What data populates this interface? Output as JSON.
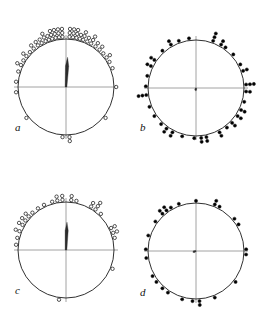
{
  "figure": {
    "type": "circular-scatter-multi-panel",
    "background": "#ffffff",
    "width": 264,
    "height": 325,
    "stroke_color": "#1a1a1a",
    "axis_color": "#8a8a8a",
    "marker_open_color": "#1a1a1a",
    "marker_fill_color": "#000000",
    "panel_count": 4,
    "layout": "2x2"
  },
  "chart_data": [
    {
      "type": "scatter",
      "subtype": "circular-distribution",
      "title": "a",
      "panel": "a",
      "marker_style": "open-circle",
      "center": [
        66,
        87
      ],
      "radius": 48,
      "axes": {
        "grid": true,
        "horizontal_axis": true,
        "vertical_axis": true
      },
      "angle_units": "degrees",
      "angle_convention": "0 = up (north), clockwise",
      "mean_vector": {
        "angle": 3,
        "length_fraction": 0.62,
        "label": "mean-resultant-vector"
      },
      "points": [
        {
          "angle": 356,
          "stack": 1
        },
        {
          "angle": 356,
          "stack": 2
        },
        {
          "angle": 356,
          "stack": 3
        },
        {
          "angle": 352,
          "stack": 1
        },
        {
          "angle": 352,
          "stack": 2
        },
        {
          "angle": 352,
          "stack": 3
        },
        {
          "angle": 348,
          "stack": 1
        },
        {
          "angle": 348,
          "stack": 2
        },
        {
          "angle": 348,
          "stack": 3
        },
        {
          "angle": 344,
          "stack": 1
        },
        {
          "angle": 344,
          "stack": 2
        },
        {
          "angle": 344,
          "stack": 3
        },
        {
          "angle": 340,
          "stack": 1
        },
        {
          "angle": 340,
          "stack": 2
        },
        {
          "angle": 336,
          "stack": 1
        },
        {
          "angle": 336,
          "stack": 2
        },
        {
          "angle": 336,
          "stack": 3
        },
        {
          "angle": 331,
          "stack": 1
        },
        {
          "angle": 331,
          "stack": 2
        },
        {
          "angle": 326,
          "stack": 1
        },
        {
          "angle": 326,
          "stack": 2
        },
        {
          "angle": 320,
          "stack": 1
        },
        {
          "angle": 320,
          "stack": 2
        },
        {
          "angle": 314,
          "stack": 1
        },
        {
          "angle": 308,
          "stack": 1
        },
        {
          "angle": 308,
          "stack": 2
        },
        {
          "angle": 302,
          "stack": 1
        },
        {
          "angle": 296,
          "stack": 1
        },
        {
          "angle": 296,
          "stack": 2
        },
        {
          "angle": 288,
          "stack": 1
        },
        {
          "angle": 276,
          "stack": 1
        },
        {
          "angle": 4,
          "stack": 1
        },
        {
          "angle": 4,
          "stack": 2
        },
        {
          "angle": 4,
          "stack": 3
        },
        {
          "angle": 8,
          "stack": 1
        },
        {
          "angle": 8,
          "stack": 2
        },
        {
          "angle": 8,
          "stack": 3
        },
        {
          "angle": 12,
          "stack": 1
        },
        {
          "angle": 12,
          "stack": 2
        },
        {
          "angle": 12,
          "stack": 3
        },
        {
          "angle": 16,
          "stack": 1
        },
        {
          "angle": 16,
          "stack": 2
        },
        {
          "angle": 20,
          "stack": 1
        },
        {
          "angle": 20,
          "stack": 2
        },
        {
          "angle": 20,
          "stack": 3
        },
        {
          "angle": 25,
          "stack": 1
        },
        {
          "angle": 25,
          "stack": 2
        },
        {
          "angle": 30,
          "stack": 1
        },
        {
          "angle": 30,
          "stack": 2
        },
        {
          "angle": 30,
          "stack": 3
        },
        {
          "angle": 36,
          "stack": 1
        },
        {
          "angle": 36,
          "stack": 2
        },
        {
          "angle": 42,
          "stack": 1
        },
        {
          "angle": 42,
          "stack": 2
        },
        {
          "angle": 48,
          "stack": 1
        },
        {
          "angle": 54,
          "stack": 1
        },
        {
          "angle": 54,
          "stack": 2
        },
        {
          "angle": 60,
          "stack": 1
        },
        {
          "angle": 68,
          "stack": 1
        },
        {
          "angle": 90,
          "stack": 1
        },
        {
          "angle": 128,
          "stack": 1
        },
        {
          "angle": 176,
          "stack": 1
        },
        {
          "angle": 176,
          "stack": 2
        },
        {
          "angle": 184,
          "stack": 1
        },
        {
          "angle": 232,
          "stack": 1
        },
        {
          "angle": 264,
          "stack": 1
        }
      ]
    },
    {
      "type": "scatter",
      "subtype": "circular-distribution",
      "title": "b",
      "panel": "b",
      "marker_style": "filled-dot",
      "center": [
        196,
        88
      ],
      "radius": 48,
      "axes": {
        "grid": true,
        "horizontal_axis": true,
        "vertical_axis": true
      },
      "angle_units": "degrees",
      "angle_convention": "0 = up (north), clockwise",
      "mean_vector": {
        "angle": 190,
        "length_fraction": 0.06,
        "label": "mean-resultant-vector"
      },
      "points": [
        {
          "angle": 352,
          "stack": 1
        },
        {
          "angle": 20,
          "stack": 1
        },
        {
          "angle": 20,
          "stack": 2
        },
        {
          "angle": 20,
          "stack": 3
        },
        {
          "angle": 30,
          "stack": 1
        },
        {
          "angle": 30,
          "stack": 2
        },
        {
          "angle": 36,
          "stack": 1
        },
        {
          "angle": 48,
          "stack": 1
        },
        {
          "angle": 62,
          "stack": 1
        },
        {
          "angle": 70,
          "stack": 1
        },
        {
          "angle": 70,
          "stack": 2
        },
        {
          "angle": 86,
          "stack": 1
        },
        {
          "angle": 86,
          "stack": 2
        },
        {
          "angle": 86,
          "stack": 3
        },
        {
          "angle": 94,
          "stack": 1
        },
        {
          "angle": 94,
          "stack": 2
        },
        {
          "angle": 106,
          "stack": 1
        },
        {
          "angle": 116,
          "stack": 1
        },
        {
          "angle": 116,
          "stack": 2
        },
        {
          "angle": 124,
          "stack": 1
        },
        {
          "angle": 124,
          "stack": 2
        },
        {
          "angle": 134,
          "stack": 1
        },
        {
          "angle": 134,
          "stack": 2
        },
        {
          "angle": 142,
          "stack": 1
        },
        {
          "angle": 152,
          "stack": 1
        },
        {
          "angle": 152,
          "stack": 2
        },
        {
          "angle": 168,
          "stack": 1
        },
        {
          "angle": 168,
          "stack": 2
        },
        {
          "angle": 174,
          "stack": 1
        },
        {
          "angle": 174,
          "stack": 2
        },
        {
          "angle": 182,
          "stack": 1
        },
        {
          "angle": 196,
          "stack": 1
        },
        {
          "angle": 208,
          "stack": 1
        },
        {
          "angle": 208,
          "stack": 2
        },
        {
          "angle": 216,
          "stack": 1
        },
        {
          "angle": 216,
          "stack": 2
        },
        {
          "angle": 224,
          "stack": 1
        },
        {
          "angle": 236,
          "stack": 1
        },
        {
          "angle": 248,
          "stack": 1
        },
        {
          "angle": 262,
          "stack": 1
        },
        {
          "angle": 262,
          "stack": 2
        },
        {
          "angle": 262,
          "stack": 3
        },
        {
          "angle": 272,
          "stack": 1
        },
        {
          "angle": 284,
          "stack": 1
        },
        {
          "angle": 296,
          "stack": 1
        },
        {
          "angle": 296,
          "stack": 2
        },
        {
          "angle": 304,
          "stack": 1
        },
        {
          "angle": 304,
          "stack": 2
        },
        {
          "angle": 318,
          "stack": 1
        },
        {
          "angle": 330,
          "stack": 1
        },
        {
          "angle": 330,
          "stack": 2
        },
        {
          "angle": 340,
          "stack": 1
        }
      ]
    },
    {
      "type": "scatter",
      "subtype": "circular-distribution",
      "title": "c",
      "panel": "c",
      "marker_style": "open-circle",
      "center": [
        66,
        250
      ],
      "radius": 48,
      "axes": {
        "grid": true,
        "horizontal_axis": true,
        "vertical_axis": true
      },
      "angle_units": "degrees",
      "angle_convention": "0 = up (north), clockwise",
      "mean_vector": {
        "angle": 2,
        "length_fraction": 0.58,
        "label": "mean-resultant-vector"
      },
      "points": [
        {
          "angle": 356,
          "stack": 1
        },
        {
          "angle": 356,
          "stack": 2
        },
        {
          "angle": 350,
          "stack": 1
        },
        {
          "angle": 350,
          "stack": 2
        },
        {
          "angle": 344,
          "stack": 1
        },
        {
          "angle": 334,
          "stack": 1
        },
        {
          "angle": 326,
          "stack": 1
        },
        {
          "angle": 318,
          "stack": 1
        },
        {
          "angle": 312,
          "stack": 1
        },
        {
          "angle": 312,
          "stack": 2
        },
        {
          "angle": 306,
          "stack": 1
        },
        {
          "angle": 306,
          "stack": 2
        },
        {
          "angle": 300,
          "stack": 1
        },
        {
          "angle": 300,
          "stack": 2
        },
        {
          "angle": 292,
          "stack": 1
        },
        {
          "angle": 292,
          "stack": 2
        },
        {
          "angle": 284,
          "stack": 1
        },
        {
          "angle": 276,
          "stack": 1
        },
        {
          "angle": 6,
          "stack": 1
        },
        {
          "angle": 6,
          "stack": 2
        },
        {
          "angle": 12,
          "stack": 1
        },
        {
          "angle": 30,
          "stack": 1
        },
        {
          "angle": 30,
          "stack": 2
        },
        {
          "angle": 36,
          "stack": 1
        },
        {
          "angle": 36,
          "stack": 2
        },
        {
          "angle": 36,
          "stack": 3
        },
        {
          "angle": 44,
          "stack": 1
        },
        {
          "angle": 64,
          "stack": 1
        },
        {
          "angle": 64,
          "stack": 2
        },
        {
          "angle": 70,
          "stack": 1
        },
        {
          "angle": 70,
          "stack": 2
        },
        {
          "angle": 76,
          "stack": 1
        },
        {
          "angle": 112,
          "stack": 1
        },
        {
          "angle": 188,
          "stack": 1
        }
      ]
    },
    {
      "type": "scatter",
      "subtype": "circular-distribution",
      "title": "d",
      "panel": "d",
      "marker_style": "filled-dot",
      "center": [
        196,
        251
      ],
      "radius": 48,
      "axes": {
        "grid": true,
        "horizontal_axis": true,
        "vertical_axis": true
      },
      "angle_units": "degrees",
      "angle_convention": "0 = up (north), clockwise",
      "mean_vector": {
        "angle": 250,
        "length_fraction": 0.07,
        "label": "mean-resultant-vector"
      },
      "points": [
        {
          "angle": 0,
          "stack": 1
        },
        {
          "angle": 22,
          "stack": 1
        },
        {
          "angle": 22,
          "stack": 2
        },
        {
          "angle": 28,
          "stack": 1
        },
        {
          "angle": 50,
          "stack": 1
        },
        {
          "angle": 58,
          "stack": 1
        },
        {
          "angle": 88,
          "stack": 1
        },
        {
          "angle": 94,
          "stack": 1
        },
        {
          "angle": 128,
          "stack": 1
        },
        {
          "angle": 158,
          "stack": 1
        },
        {
          "angle": 176,
          "stack": 1
        },
        {
          "angle": 176,
          "stack": 2
        },
        {
          "angle": 184,
          "stack": 1
        },
        {
          "angle": 196,
          "stack": 1
        },
        {
          "angle": 214,
          "stack": 1
        },
        {
          "angle": 222,
          "stack": 1
        },
        {
          "angle": 232,
          "stack": 1
        },
        {
          "angle": 240,
          "stack": 1
        },
        {
          "angle": 262,
          "stack": 1
        },
        {
          "angle": 272,
          "stack": 1
        },
        {
          "angle": 288,
          "stack": 1
        },
        {
          "angle": 306,
          "stack": 1
        },
        {
          "angle": 318,
          "stack": 1
        },
        {
          "angle": 318,
          "stack": 2
        },
        {
          "angle": 324,
          "stack": 1
        },
        {
          "angle": 324,
          "stack": 2
        },
        {
          "angle": 330,
          "stack": 1
        },
        {
          "angle": 340,
          "stack": 1
        }
      ]
    }
  ],
  "labels": {
    "a": "a",
    "b": "b",
    "c": "c",
    "d": "d"
  }
}
